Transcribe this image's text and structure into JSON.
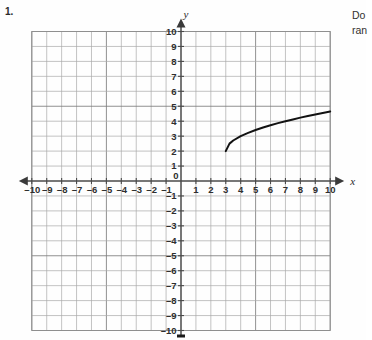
{
  "page": {
    "problem_number": "1.",
    "question_text_lines": [
      "Do",
      "ran"
    ]
  },
  "graph": {
    "x_axis_label": "x",
    "y_axis_label": "y",
    "origin_label": "0",
    "x_tick_labels_negative": [
      "-10",
      "-9",
      "-8",
      "-7",
      "-6",
      "-5",
      "-4",
      "-3",
      "-2",
      "-1"
    ],
    "x_tick_labels_positive": [
      "1",
      "2",
      "3",
      "4",
      "5",
      "6",
      "7",
      "8",
      "9",
      "10"
    ],
    "y_tick_labels_positive": [
      "1",
      "2",
      "3",
      "4",
      "5",
      "6",
      "7",
      "8",
      "9",
      "10"
    ],
    "y_tick_labels_negative": [
      "-1",
      "-2",
      "-3",
      "-4",
      "-5",
      "-6",
      "-7",
      "-8",
      "-9",
      "-10"
    ],
    "colors": {
      "grid": "#a9a9a9",
      "grid_major": "#7d7d7d",
      "axis": "#4a4a4a",
      "curve": "#121212",
      "page_background": "#fefefe"
    }
  },
  "chart_data": {
    "type": "line",
    "title": "",
    "xlabel": "x",
    "ylabel": "y",
    "xlim": [
      -10,
      10
    ],
    "ylim": [
      -10,
      10
    ],
    "grid": true,
    "legend": "none",
    "xticks": [
      -10,
      -9,
      -8,
      -7,
      -6,
      -5,
      -4,
      -3,
      -2,
      -1,
      0,
      1,
      2,
      3,
      4,
      5,
      6,
      7,
      8,
      9,
      10
    ],
    "yticks": [
      -10,
      -9,
      -8,
      -7,
      -6,
      -5,
      -4,
      -3,
      -2,
      -1,
      0,
      1,
      2,
      3,
      4,
      5,
      6,
      7,
      8,
      9,
      10
    ],
    "series": [
      {
        "name": "y = sqrt(x - 3) + 2",
        "x": [
          3,
          3.25,
          3.5,
          4,
          4.5,
          5,
          5.5,
          6,
          6.5,
          7,
          7.5,
          8,
          8.5,
          9,
          9.5,
          10
        ],
        "y": [
          2,
          2.5,
          2.71,
          3,
          3.22,
          3.41,
          3.58,
          3.73,
          3.87,
          4,
          4.12,
          4.24,
          4.35,
          4.45,
          4.55,
          4.65
        ],
        "endpoint_start": [
          3,
          2
        ],
        "endpoint_end": [
          10,
          4.65
        ]
      }
    ]
  }
}
